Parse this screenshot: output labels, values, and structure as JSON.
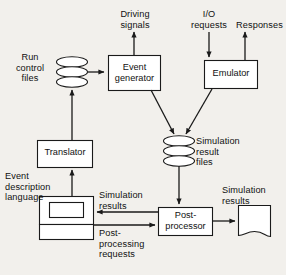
{
  "diagram": {
    "background_color": "#f2f0ec",
    "line_color": "#1a1a1a",
    "box_fill": "#ffffff",
    "nodes": {
      "run_control_files": {
        "label": "Run\ncontrol\nfiles",
        "shape": "disk-stack"
      },
      "event_generator": {
        "label": "Event\ngenerator",
        "shape": "process-box"
      },
      "emulator": {
        "label": "Emulator",
        "shape": "process-box"
      },
      "translator": {
        "label": "Translator",
        "shape": "process-box"
      },
      "terminal": {
        "label": "",
        "shape": "terminal"
      },
      "simulation_result_files": {
        "label": "Simulation\nresult\nfiles",
        "shape": "disk-stack"
      },
      "post_processor": {
        "label": "Post-\nprocessor",
        "shape": "process-box"
      },
      "simulation_results_doc": {
        "label": "Simulation\nresults",
        "shape": "document"
      }
    },
    "edge_labels": {
      "driving_signals": "Driving\nsignals",
      "io_requests": "I/O\nrequests",
      "responses": "Responses",
      "event_description_language": "Event\ndescription\nlanguage",
      "simulation_results": "Simulation\nresults",
      "post_processing_requests": "Post-\nprocessing\nrequests"
    }
  }
}
